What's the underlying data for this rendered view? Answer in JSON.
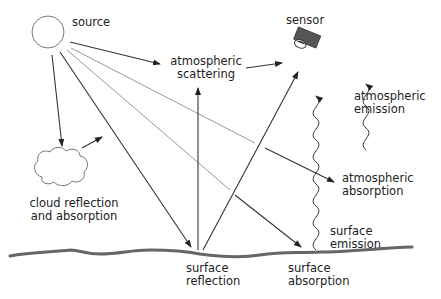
{
  "diagram": {
    "labels": {
      "source": "source",
      "sensor": "sensor",
      "atm_scattering_1": "atmospheric",
      "atm_scattering_2": "scattering",
      "atm_emission_1": "atmospheric",
      "atm_emission_2": "emission",
      "atm_absorption_1": "atmospheric",
      "atm_absorption_2": "absorption",
      "cloud_1": "cloud reflection",
      "cloud_2": "and absorption",
      "surface_emission_1": "surface",
      "surface_emission_2": "emission",
      "surface_reflection_1": "surface",
      "surface_reflection_2": "reflection",
      "surface_absorption_1": "surface",
      "surface_absorption_2": "absorption"
    },
    "colors": {
      "line_dark": "#333333",
      "line_light": "#888888",
      "surface": "#666666",
      "sensor_body": "#555555"
    }
  }
}
